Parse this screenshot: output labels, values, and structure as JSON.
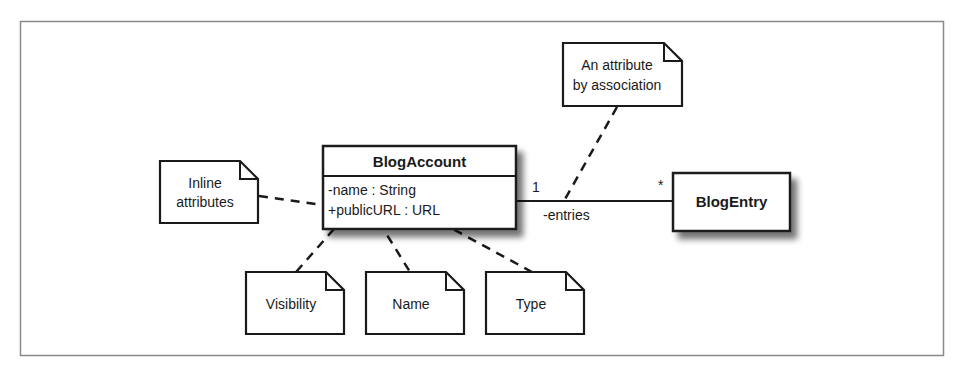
{
  "diagram": {
    "classes": {
      "blog_account": {
        "name": "BlogAccount",
        "attributes": [
          "-name : String",
          "+publicURL : URL"
        ]
      },
      "blog_entry": {
        "name": "BlogEntry"
      }
    },
    "association": {
      "source_multiplicity": "1",
      "target_multiplicity": "*",
      "role_name": "-entries"
    },
    "notes": {
      "association_note": [
        "An attribute",
        "by association"
      ],
      "inline_note": [
        "Inline",
        "attributes"
      ],
      "visibility_note": "Visibility",
      "name_note": "Name",
      "type_note": "Type"
    },
    "colors": {
      "stroke": "#1a1a1a",
      "frame": "#8a8a8a",
      "shadow": "#9a9a9a",
      "background": "#ffffff"
    }
  }
}
